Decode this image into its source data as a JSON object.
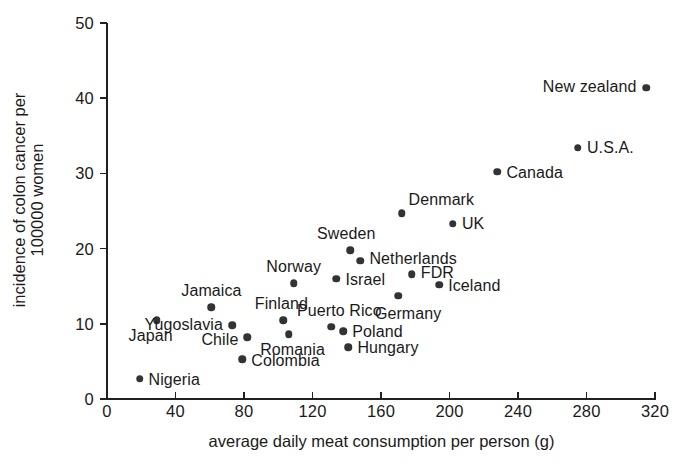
{
  "chart_data": {
    "type": "scatter",
    "title": "",
    "subtitle": "",
    "xlabel": "average daily meat consumption per person (g)",
    "ylabel_line1": "incidence of colon cancer per",
    "ylabel_line2": "100000 women",
    "ylabel": "incidence of colon cancer per 100000 women",
    "xlim": [
      0,
      320
    ],
    "ylim": [
      0,
      50
    ],
    "xticks": [
      0,
      40,
      80,
      120,
      160,
      200,
      240,
      280,
      320
    ],
    "yticks": [
      0,
      10,
      20,
      30,
      40,
      50
    ],
    "xtick_labels": [
      "0",
      "40",
      "80",
      "120",
      "160",
      "200",
      "240",
      "280",
      "320"
    ],
    "ytick_labels": [
      "0",
      "10",
      "20",
      "30",
      "40",
      "50"
    ],
    "grid": false,
    "legend": "none",
    "marker_color": "#333333",
    "axis_color": "#202020",
    "background": "#ffffff",
    "points": [
      {
        "label": "New zealand",
        "x": 315,
        "y": 41.4,
        "label_pos": "left",
        "dx": -10,
        "dy": -1
      },
      {
        "label": "U.S.A.",
        "x": 275,
        "y": 33.4,
        "label_pos": "right",
        "dx": 9,
        "dy": 0
      },
      {
        "label": "Canada",
        "x": 228,
        "y": 30.2,
        "label_pos": "right",
        "dx": 9,
        "dy": 1
      },
      {
        "label": "Denmark",
        "x": 172,
        "y": 24.7,
        "label_pos": "right",
        "dx": 7,
        "dy": -13
      },
      {
        "label": "UK",
        "x": 202,
        "y": 23.3,
        "label_pos": "right",
        "dx": 9,
        "dy": 0
      },
      {
        "label": "Sweden",
        "x": 142,
        "y": 19.8,
        "label_pos": "above",
        "dx": -4,
        "dy": -7
      },
      {
        "label": "Netherlands",
        "x": 148,
        "y": 18.4,
        "label_pos": "right",
        "dx": 9,
        "dy": -2
      },
      {
        "label": "FDR",
        "x": 178,
        "y": 16.6,
        "label_pos": "right",
        "dx": 9,
        "dy": -1
      },
      {
        "label": "Norway",
        "x": 109,
        "y": 15.4,
        "label_pos": "above",
        "dx": 0,
        "dy": -7
      },
      {
        "label": "Iceland",
        "x": 194,
        "y": 15.2,
        "label_pos": "right",
        "dx": 9,
        "dy": 1
      },
      {
        "label": "Israel",
        "x": 134,
        "y": 16.0,
        "label_pos": "right",
        "dx": 9,
        "dy": 1
      },
      {
        "label": "Germany",
        "x": 170,
        "y": 13.7,
        "label_pos": "below",
        "dx": 10,
        "dy": 9
      },
      {
        "label": "Jamaica",
        "x": 61,
        "y": 12.2,
        "label_pos": "above",
        "dx": 0,
        "dy": -7
      },
      {
        "label": "Finland",
        "x": 103,
        "y": 10.5,
        "label_pos": "above",
        "dx": -2,
        "dy": -7
      },
      {
        "label": "Japan",
        "x": 29,
        "y": 10.5,
        "label_pos": "below",
        "dx": -6,
        "dy": 7
      },
      {
        "label": "Yugoslavia",
        "x": 73,
        "y": 9.8,
        "label_pos": "left",
        "dx": -9,
        "dy": 0
      },
      {
        "label": "Puerto Rico",
        "x": 131,
        "y": 9.6,
        "label_pos": "above",
        "dx": 8,
        "dy": -7
      },
      {
        "label": "Poland",
        "x": 138,
        "y": 9.0,
        "label_pos": "right",
        "dx": 9,
        "dy": 1
      },
      {
        "label": "Romania",
        "x": 106,
        "y": 8.6,
        "label_pos": "below",
        "dx": 4,
        "dy": 7
      },
      {
        "label": "Chile",
        "x": 82,
        "y": 8.2,
        "label_pos": "left",
        "dx": -9,
        "dy": 3
      },
      {
        "label": "Hungary",
        "x": 141,
        "y": 6.9,
        "label_pos": "right",
        "dx": 9,
        "dy": 1
      },
      {
        "label": "Colombia",
        "x": 79,
        "y": 5.3,
        "label_pos": "right",
        "dx": 9,
        "dy": 2
      },
      {
        "label": "Nigeria",
        "x": 19,
        "y": 2.7,
        "label_pos": "right",
        "dx": 9,
        "dy": 1
      }
    ]
  }
}
